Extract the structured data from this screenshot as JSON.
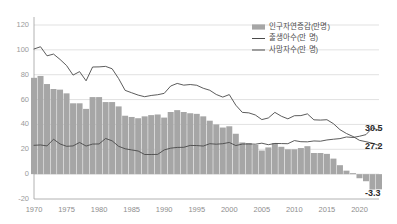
{
  "chart_data": {
    "type": "bar",
    "title": "",
    "xlabel": "",
    "ylabel": "",
    "ylim": [
      -20,
      120
    ],
    "xlim": [
      1970,
      2023
    ],
    "grid": true,
    "legend_position": "top-right",
    "yticks": [
      "120",
      "100",
      "80",
      "60",
      "40",
      "20",
      "0",
      "-20"
    ],
    "ytick_values": [
      120,
      100,
      80,
      60,
      40,
      20,
      0,
      -20
    ],
    "xticks": [
      "1970",
      "1975",
      "1980",
      "1985",
      "1990",
      "1995",
      "2000",
      "2005",
      "2010",
      "2015",
      "2020"
    ],
    "xtick_values": [
      1970,
      1975,
      1980,
      1985,
      1990,
      1995,
      2000,
      2005,
      2010,
      2015,
      2020
    ],
    "x": [
      1970,
      1971,
      1972,
      1973,
      1974,
      1975,
      1976,
      1977,
      1978,
      1979,
      1980,
      1981,
      1982,
      1983,
      1984,
      1985,
      1986,
      1987,
      1988,
      1989,
      1990,
      1991,
      1992,
      1993,
      1994,
      1995,
      1996,
      1997,
      1998,
      1999,
      2000,
      2001,
      2002,
      2003,
      2004,
      2005,
      2006,
      2007,
      2008,
      2009,
      2010,
      2011,
      2012,
      2013,
      2014,
      2015,
      2016,
      2017,
      2018,
      2019,
      2020,
      2021,
      2022,
      2023
    ],
    "series": [
      {
        "name": "인구자연증감(만명)",
        "type": "bar",
        "unit": "만명",
        "values": [
          77.5,
          79.0,
          72.5,
          68.5,
          68.0,
          65.0,
          57.0,
          57.0,
          52.5,
          62.0,
          62.0,
          58.0,
          58.0,
          54.5,
          47.0,
          46.0,
          45.0,
          46.5,
          47.5,
          48.0,
          45.5,
          50.0,
          51.5,
          50.0,
          49.0,
          48.5,
          46.5,
          43.0,
          40.0,
          37.5,
          38.5,
          32.5,
          25.5,
          25.0,
          23.5,
          19.0,
          21.5,
          25.0,
          22.0,
          20.0,
          20.0,
          21.0,
          22.5,
          17.0,
          17.0,
          16.3,
          12.5,
          7.2,
          2.8,
          0.8,
          -3.3,
          -5.7,
          -12.4,
          -12.2
        ]
      },
      {
        "name": "출생아수(만 명)",
        "type": "line",
        "unit": "만 명",
        "values": [
          100.7,
          102.5,
          95.2,
          96.6,
          92.3,
          87.4,
          79.7,
          82.5,
          75.1,
          86.2,
          86.3,
          86.7,
          84.8,
          76.9,
          67.4,
          65.5,
          63.6,
          62.3,
          63.3,
          63.9,
          65.0,
          70.9,
          73.0,
          71.6,
          72.1,
          71.5,
          69.1,
          67.5,
          64.1,
          62.0,
          64.0,
          55.5,
          49.7,
          49.3,
          47.6,
          43.9,
          45.2,
          49.7,
          46.6,
          44.5,
          47.0,
          47.1,
          48.5,
          43.7,
          43.5,
          43.8,
          40.6,
          35.8,
          32.7,
          30.3,
          27.2,
          26.1,
          24.9,
          23.0
        ]
      },
      {
        "name": "사망자수(만 명)",
        "type": "line",
        "unit": "만 명",
        "values": [
          23.2,
          23.5,
          22.7,
          28.1,
          24.3,
          22.4,
          22.7,
          25.5,
          22.6,
          24.2,
          24.3,
          28.7,
          26.8,
          22.4,
          20.4,
          19.5,
          18.6,
          15.8,
          15.8,
          15.9,
          19.5,
          20.9,
          21.5,
          21.6,
          23.1,
          23.0,
          22.6,
          24.5,
          24.1,
          24.5,
          25.5,
          23.0,
          24.2,
          24.3,
          24.1,
          24.9,
          23.7,
          24.7,
          24.6,
          24.5,
          27.0,
          26.1,
          26.0,
          26.7,
          26.5,
          27.5,
          28.1,
          28.6,
          29.9,
          29.5,
          30.5,
          31.8,
          37.3,
          35.2
        ]
      }
    ],
    "annotations": [
      {
        "label": "30.5",
        "series": "사망자수(만 명)",
        "x": 2020,
        "y": 30.5
      },
      {
        "label": "27.2",
        "series": "출생아수(만 명)",
        "x": 2020,
        "y": 27.2
      },
      {
        "label": "-3.3",
        "series": "인구자연증감(만명)",
        "x": 2020,
        "y": -3.3
      }
    ]
  }
}
